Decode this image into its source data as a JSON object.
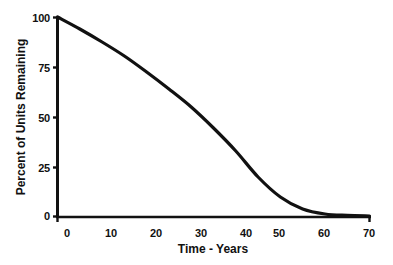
{
  "chart_data": {
    "type": "line",
    "title": "",
    "xlabel": "Time - Years",
    "ylabel": "Percent of Units Remaining",
    "xlim": [
      0,
      70
    ],
    "ylim": [
      0,
      100
    ],
    "xticks": [
      0,
      10,
      20,
      30,
      40,
      50,
      60,
      70
    ],
    "xtick_labels": [
      "0",
      "10",
      "20",
      "30",
      "40",
      "50",
      "60",
      "70"
    ],
    "yticks": [
      0,
      25,
      50,
      75,
      100
    ],
    "ytick_labels": [
      "0",
      "25",
      "50",
      "75",
      "100"
    ],
    "grid": false,
    "legend": null,
    "line_color": "#111111",
    "line_width": 3,
    "series": [
      {
        "name": "Percent of Units Remaining",
        "x": [
          0,
          5,
          10,
          15,
          20,
          25,
          30,
          35,
          40,
          45,
          50,
          55,
          60,
          65,
          70
        ],
        "values": [
          100,
          94,
          87.5,
          80.5,
          72.5,
          64,
          55,
          44.5,
          33,
          20,
          10,
          4,
          1.5,
          0.8,
          0.5
        ]
      }
    ],
    "annotations": []
  },
  "axis": {
    "x_title": "Time - Years",
    "y_title": "Percent of Units Remaining"
  },
  "colors": {
    "background": "#ffffff",
    "foreground": "#111111",
    "curve": "#111111"
  }
}
